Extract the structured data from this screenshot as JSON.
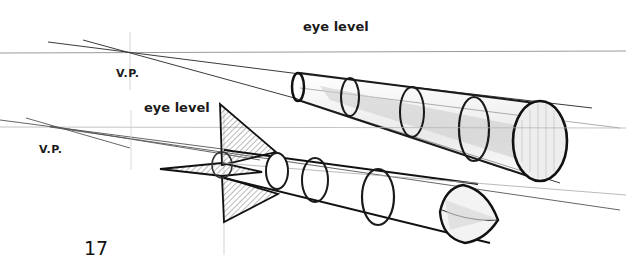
{
  "figure": {
    "top_sketch": {
      "eye_level_label": "eye level",
      "vanishing_point_label": "V.P.",
      "subject": "cylinder-in-perspective"
    },
    "bottom_sketch": {
      "eye_level_label": "eye level",
      "vanishing_point_label": "V.P.",
      "subject": "rocket-in-perspective"
    },
    "page_number": "17"
  },
  "colors": {
    "ink": "#1a1a1a",
    "guide_line": "#9a9a9a",
    "background": "#ffffff"
  }
}
